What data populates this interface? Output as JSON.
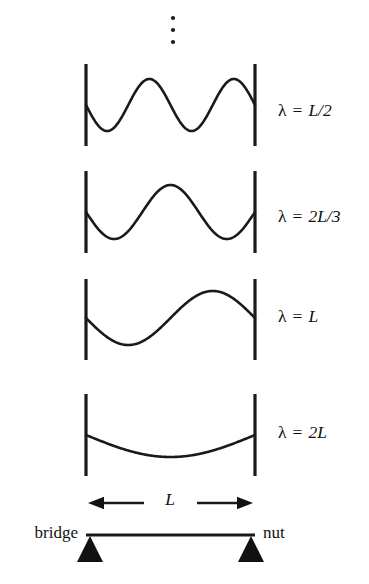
{
  "figure": {
    "background_color": "#ffffff",
    "ink_color": "#1a1a1a",
    "width": 369,
    "height": 584
  },
  "continuation": {
    "symbol_name": "vertical-ellipsis",
    "dot_count": 3,
    "x": 173,
    "dot_ys": [
      18,
      30,
      42
    ]
  },
  "string": {
    "left_x": 86,
    "right_x": 255,
    "length_label": "L",
    "left_end_label": "bridge",
    "right_end_label": "nut"
  },
  "modes": [
    {
      "index": 1,
      "label": "λ = L/2",
      "label_lambda": "λ",
      "label_equals": "=",
      "label_value": "L/2",
      "harmonic": 4,
      "half_wavelengths": 4,
      "center_y": 105,
      "bar_top": 64,
      "bar_bottom": 146,
      "amplitude": 26,
      "label_x": 278,
      "label_y": 112
    },
    {
      "index": 2,
      "label": "λ = 2L/3",
      "label_lambda": "λ",
      "label_equals": "=",
      "label_value": "2L/3",
      "harmonic": 3,
      "half_wavelengths": 3,
      "center_y": 212,
      "bar_top": 171,
      "bar_bottom": 253,
      "amplitude": 27,
      "label_x": 278,
      "label_y": 218
    },
    {
      "index": 3,
      "label": "λ = L",
      "label_lambda": "λ",
      "label_equals": "=",
      "label_value": "L",
      "harmonic": 2,
      "half_wavelengths": 2,
      "center_y": 318,
      "bar_top": 279,
      "bar_bottom": 360,
      "amplitude": 27,
      "label_x": 278,
      "label_y": 318
    },
    {
      "index": 4,
      "label": "λ = 2L",
      "label_lambda": "λ",
      "label_equals": "=",
      "label_value": "2L",
      "harmonic": 1,
      "half_wavelengths": 1,
      "center_y": 435,
      "bar_top": 394,
      "bar_bottom": 476,
      "amplitude": 22,
      "label_x": 278,
      "label_y": 434
    }
  ],
  "dimension": {
    "label": "L",
    "label_x": 170,
    "label_y": 501,
    "arrow_y": 503,
    "left_arrow_tip_x": 88,
    "left_arrow_tail_x": 144,
    "right_arrow_tail_x": 197,
    "right_arrow_tip_x": 253
  },
  "fixture": {
    "bar_y": 535,
    "bar_left_x": 86,
    "bar_right_x": 255,
    "left_label": "bridge",
    "left_label_x": 78,
    "left_label_y": 534,
    "right_label": "nut",
    "right_label_x": 263,
    "right_label_y": 534,
    "triangle_half_width": 13,
    "triangle_height": 26
  }
}
